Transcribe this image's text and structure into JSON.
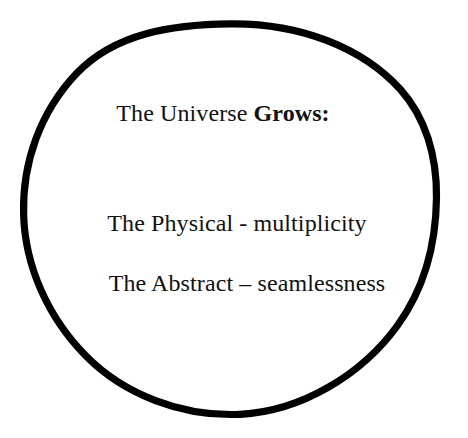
{
  "diagram": {
    "type": "venn-single-circle",
    "shape_name": "circle",
    "background_color": "#ffffff",
    "stroke_color": "#000000",
    "text_color": "#111111",
    "heading": {
      "prefix": "The Universe ",
      "emphasis": "Grows:"
    },
    "items": [
      {
        "label": "The Physical - multiplicity",
        "term": "The Physical",
        "separator": "-",
        "description": "multiplicity"
      },
      {
        "label": "The Abstract – seamlessness",
        "term": "The Abstract",
        "separator": "–",
        "description": "seamlessness"
      }
    ]
  }
}
